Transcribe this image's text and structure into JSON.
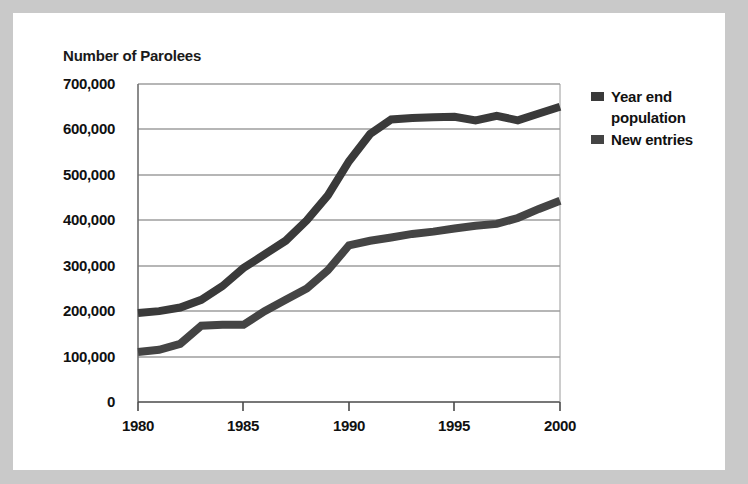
{
  "figure": {
    "background_outer": "#c9c9c9",
    "background_paper": "#ffffff",
    "axis_title": "Number of Parolees"
  },
  "legend": {
    "position": "right",
    "entries": [
      {
        "label": "Year end population",
        "color": "#3a3a3a",
        "marker": "legend-swatch-square"
      },
      {
        "label": "New entries",
        "color": "#444444",
        "marker": "legend-swatch-square"
      }
    ]
  },
  "axes": {
    "y_ticks": [
      "700,000",
      "600,000",
      "500,000",
      "400,000",
      "300,000",
      "200,000",
      "100,000",
      "0"
    ],
    "x_ticks": [
      "1980",
      "1985",
      "1990",
      "1995",
      "2000"
    ]
  },
  "chart_data": {
    "type": "line",
    "title": "",
    "subtitle": "",
    "xlabel": "",
    "ylabel": "Number of Parolees",
    "xlim": [
      1980,
      2000
    ],
    "ylim": [
      0,
      700000
    ],
    "grid": true,
    "grid_axis": "y",
    "legend_position": "right",
    "x": [
      1980,
      1981,
      1982,
      1983,
      1984,
      1985,
      1986,
      1987,
      1988,
      1989,
      1990,
      1991,
      1992,
      1993,
      1994,
      1995,
      1996,
      1997,
      1998,
      1999,
      2000
    ],
    "series": [
      {
        "name": "Year end population",
        "color": "#3a3a3a",
        "values": [
          196000,
          200000,
          208000,
          225000,
          255000,
          295000,
          325000,
          355000,
          400000,
          455000,
          530000,
          590000,
          622000,
          625000,
          627000,
          628000,
          620000,
          630000,
          620000,
          635000,
          650000
        ]
      },
      {
        "name": "New entries",
        "color": "#444444",
        "values": [
          110000,
          115000,
          128000,
          168000,
          170000,
          170000,
          200000,
          225000,
          250000,
          290000,
          345000,
          355000,
          362000,
          370000,
          375000,
          382000,
          388000,
          392000,
          405000,
          425000,
          443000
        ]
      }
    ]
  }
}
